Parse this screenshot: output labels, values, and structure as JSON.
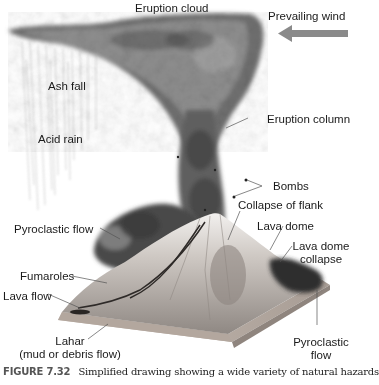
{
  "figure": {
    "caption_label": "FIGURE 7.32",
    "caption_text": "Simplified drawing showing a wide variety of natural hazards"
  },
  "labels": {
    "eruption_cloud": "Eruption cloud",
    "prevailing_wind": "Prevailing wind",
    "ash_fall": "Ash fall",
    "acid_rain": "Acid rain",
    "eruption_column": "Eruption column",
    "bombs": "Bombs",
    "collapse_of_flank": "Collapse of flank",
    "pyroclastic_flow_left": "Pyroclastic flow",
    "lava_dome": "Lava dome",
    "lava_dome_collapse_1": "Lava dome",
    "lava_dome_collapse_2": "collapse",
    "fumaroles": "Fumaroles",
    "lava_flow": "Lava flow",
    "lahar_1": "Lahar",
    "lahar_2": "(mud or debris flow)",
    "pyroclastic_flow_right_1": "Pyroclastic",
    "pyroclastic_flow_right_2": "flow"
  },
  "colors": {
    "wind_arrow": "#8a8a8a",
    "smoke_dark": "#3a3a3a",
    "smoke_mid": "#7a7a7a",
    "terrain": "#9c9590",
    "base": "#b8aea6",
    "leader": "#555555"
  }
}
